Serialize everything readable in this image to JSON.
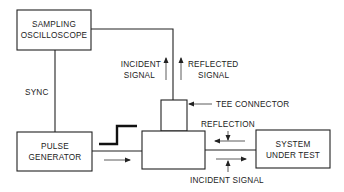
{
  "diagram": {
    "blocks": {
      "oscilloscope": [
        "SAMPLING",
        "OSCILLOSCOPE"
      ],
      "pulse_generator": [
        "PULSE",
        "GENERATOR"
      ],
      "system_under_test": [
        "SYSTEM",
        "UNDER TEST"
      ],
      "tee_connector": "TEE CONNECTOR"
    },
    "labels": {
      "sync": "SYNC",
      "incident_signal_upper": [
        "INCIDENT",
        "SIGNAL"
      ],
      "reflected_signal_upper": [
        "REFLECTED",
        "SIGNAL"
      ],
      "reflection": "REFLECTION",
      "incident_signal_lower": "INCIDENT SIGNAL"
    }
  }
}
